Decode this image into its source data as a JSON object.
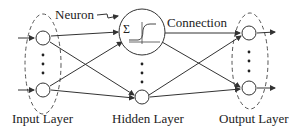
{
  "diagram": {
    "labels": {
      "neuron": "Neuron",
      "connection": "Connection",
      "input_layer": "Input Layer",
      "hidden_layer": "Hidden Layer",
      "output_layer": "Output Layer"
    },
    "neuron_symbols": {
      "sum": "Σ"
    },
    "layers": [
      {
        "name": "Input Layer",
        "nodes_shown": 2,
        "ellipsis": true
      },
      {
        "name": "Hidden Layer",
        "nodes_shown": 2,
        "ellipsis": true,
        "expanded_neuron": true
      },
      {
        "name": "Output Layer",
        "nodes_shown": 2,
        "ellipsis": true
      }
    ],
    "colors": {
      "stroke": "#333333",
      "background": "#ffffff"
    }
  }
}
